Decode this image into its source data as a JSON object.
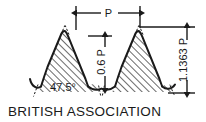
{
  "diagram": {
    "caption": "BRITISH ASSOCIATION",
    "type": "screw-thread-profile",
    "background_color": "#ffffff",
    "line_color": "#1a1a1a",
    "hatch_color": "#1a1a1a",
    "dimensions": {
      "pitch": {
        "label": "P",
        "orientation": "horizontal",
        "position": "top"
      },
      "thread_depth": {
        "label": "0.6 P",
        "orientation": "vertical",
        "position": "center"
      },
      "overall_height": {
        "label": "1.1363 P",
        "orientation": "vertical",
        "position": "right"
      },
      "flank_angle": {
        "label": "47.5°",
        "orientation": "horizontal",
        "position": "lower-left"
      }
    }
  }
}
